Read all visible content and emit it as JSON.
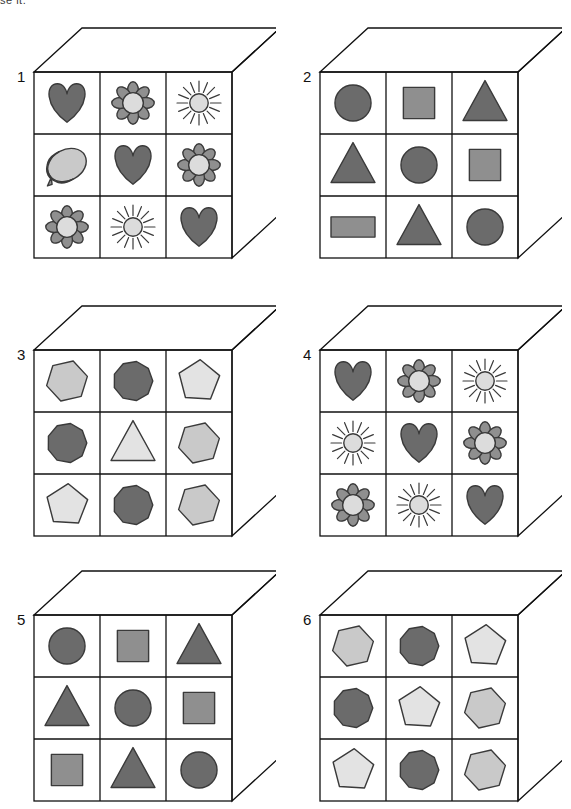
{
  "page": {
    "cut_off_text": "se it.",
    "background": "#ffffff",
    "line_color": "#111111"
  },
  "palette": {
    "dark_gray": "#6b6b6b",
    "mid_gray": "#8f8f8f",
    "light_gray": "#c9c9c9",
    "very_light_gray": "#dcdcdc",
    "pale_gray": "#e3e3e3",
    "outline": "#3a3a3a",
    "cube_stroke": "#111111",
    "face_fill": "#ffffff"
  },
  "cubes": [
    {
      "number": "1",
      "theme": "pictogram",
      "cells": [
        {
          "shape": "heart",
          "tone": "dark_gray"
        },
        {
          "shape": "flower",
          "tone": "mid_gray"
        },
        {
          "shape": "sun",
          "tone": "very_light_gray"
        },
        {
          "shape": "acorn",
          "tone": "mid_gray"
        },
        {
          "shape": "heart",
          "tone": "dark_gray"
        },
        {
          "shape": "flower",
          "tone": "mid_gray"
        },
        {
          "shape": "flower",
          "tone": "mid_gray"
        },
        {
          "shape": "sun",
          "tone": "very_light_gray"
        },
        {
          "shape": "heart",
          "tone": "dark_gray"
        }
      ]
    },
    {
      "number": "2",
      "theme": "geometric-basic",
      "cells": [
        {
          "shape": "circle",
          "tone": "dark_gray"
        },
        {
          "shape": "square",
          "tone": "mid_gray"
        },
        {
          "shape": "triangle",
          "tone": "dark_gray"
        },
        {
          "shape": "triangle",
          "tone": "dark_gray"
        },
        {
          "shape": "circle",
          "tone": "dark_gray"
        },
        {
          "shape": "square",
          "tone": "mid_gray"
        },
        {
          "shape": "rectangle",
          "tone": "mid_gray"
        },
        {
          "shape": "triangle",
          "tone": "dark_gray"
        },
        {
          "shape": "circle",
          "tone": "dark_gray"
        }
      ]
    },
    {
      "number": "3",
      "theme": "geometric-polygon",
      "cells": [
        {
          "shape": "hexagon",
          "tone": "light_gray"
        },
        {
          "shape": "octagon",
          "tone": "dark_gray"
        },
        {
          "shape": "pentagon",
          "tone": "pale_gray"
        },
        {
          "shape": "octagon",
          "tone": "dark_gray"
        },
        {
          "shape": "triangle",
          "tone": "pale_gray"
        },
        {
          "shape": "hexagon",
          "tone": "light_gray"
        },
        {
          "shape": "pentagon",
          "tone": "pale_gray"
        },
        {
          "shape": "octagon",
          "tone": "dark_gray"
        },
        {
          "shape": "hexagon",
          "tone": "light_gray"
        }
      ]
    },
    {
      "number": "4",
      "theme": "pictogram",
      "cells": [
        {
          "shape": "heart",
          "tone": "dark_gray"
        },
        {
          "shape": "flower",
          "tone": "mid_gray"
        },
        {
          "shape": "sun",
          "tone": "very_light_gray"
        },
        {
          "shape": "sun",
          "tone": "very_light_gray"
        },
        {
          "shape": "heart",
          "tone": "dark_gray"
        },
        {
          "shape": "flower",
          "tone": "mid_gray"
        },
        {
          "shape": "flower",
          "tone": "mid_gray"
        },
        {
          "shape": "sun",
          "tone": "very_light_gray"
        },
        {
          "shape": "heart",
          "tone": "dark_gray"
        }
      ]
    },
    {
      "number": "5",
      "theme": "geometric-basic",
      "cells": [
        {
          "shape": "circle",
          "tone": "dark_gray"
        },
        {
          "shape": "square",
          "tone": "mid_gray"
        },
        {
          "shape": "triangle",
          "tone": "dark_gray"
        },
        {
          "shape": "triangle",
          "tone": "dark_gray"
        },
        {
          "shape": "circle",
          "tone": "dark_gray"
        },
        {
          "shape": "square",
          "tone": "mid_gray"
        },
        {
          "shape": "square",
          "tone": "mid_gray"
        },
        {
          "shape": "triangle",
          "tone": "dark_gray"
        },
        {
          "shape": "circle",
          "tone": "dark_gray"
        }
      ]
    },
    {
      "number": "6",
      "theme": "geometric-polygon",
      "cells": [
        {
          "shape": "hexagon",
          "tone": "light_gray"
        },
        {
          "shape": "octagon",
          "tone": "dark_gray"
        },
        {
          "shape": "pentagon",
          "tone": "pale_gray"
        },
        {
          "shape": "octagon",
          "tone": "dark_gray"
        },
        {
          "shape": "pentagon",
          "tone": "pale_gray"
        },
        {
          "shape": "hexagon",
          "tone": "light_gray"
        },
        {
          "shape": "pentagon",
          "tone": "pale_gray"
        },
        {
          "shape": "octagon",
          "tone": "dark_gray"
        },
        {
          "shape": "hexagon",
          "tone": "light_gray"
        }
      ]
    }
  ],
  "layout": {
    "positions": [
      {
        "left": 14,
        "top": 14
      },
      {
        "left": 300,
        "top": 14
      },
      {
        "left": 14,
        "top": 292
      },
      {
        "left": 300,
        "top": 292
      },
      {
        "left": 14,
        "top": 557
      },
      {
        "left": 300,
        "top": 557
      }
    ],
    "columns": 2,
    "rows": 3
  }
}
